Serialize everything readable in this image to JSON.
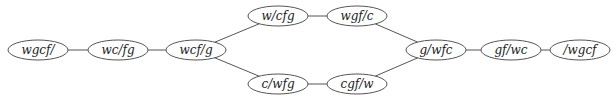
{
  "diagram": {
    "type": "state-space graph",
    "nodes": [
      {
        "id": "n1",
        "label": "wgcf/",
        "cx": 38,
        "cy": 50
      },
      {
        "id": "n2",
        "label": "wc/fg",
        "cx": 118,
        "cy": 50
      },
      {
        "id": "n3",
        "label": "wcf/g",
        "cx": 196,
        "cy": 50
      },
      {
        "id": "n4",
        "label": "w/cfg",
        "cx": 278,
        "cy": 16
      },
      {
        "id": "n5",
        "label": "wgf/c",
        "cx": 357,
        "cy": 16
      },
      {
        "id": "n6",
        "label": "c/wfg",
        "cx": 278,
        "cy": 84
      },
      {
        "id": "n7",
        "label": "cgf/w",
        "cx": 357,
        "cy": 84
      },
      {
        "id": "n8",
        "label": "g/wfc",
        "cx": 436,
        "cy": 50
      },
      {
        "id": "n9",
        "label": "gf/wc",
        "cx": 511,
        "cy": 50
      },
      {
        "id": "n10",
        "label": "/wgcf",
        "cx": 580,
        "cy": 50
      }
    ],
    "edges": [
      [
        "n1",
        "n2"
      ],
      [
        "n2",
        "n3"
      ],
      [
        "n3",
        "n4"
      ],
      [
        "n3",
        "n6"
      ],
      [
        "n4",
        "n5"
      ],
      [
        "n6",
        "n7"
      ],
      [
        "n5",
        "n8"
      ],
      [
        "n7",
        "n8"
      ],
      [
        "n8",
        "n9"
      ],
      [
        "n9",
        "n10"
      ]
    ]
  }
}
